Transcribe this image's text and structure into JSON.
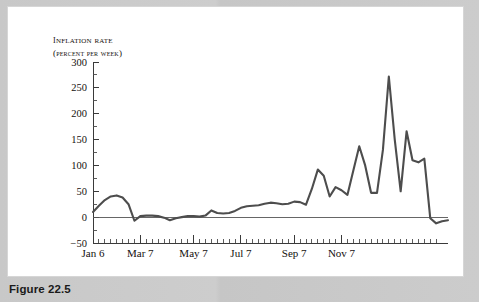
{
  "figure": {
    "caption": "Figure 22.5"
  },
  "chart_data": {
    "type": "line",
    "title": "",
    "ylabel_line1": "Inflation rate",
    "ylabel_line2": "(percent per week)",
    "xlabel": "",
    "ylim": [
      -50,
      300
    ],
    "grid": false,
    "legend": "none",
    "y_ticks": [
      300,
      250,
      200,
      150,
      100,
      50,
      0,
      -50
    ],
    "y_tick_labels": [
      "300",
      "250",
      "200",
      "150",
      "100",
      "50",
      "0",
      "−50"
    ],
    "y_minor_step": 25,
    "x_major_labels": [
      "Jan 6",
      "Mar 7",
      "May 7",
      "Jul 7",
      "Sep 7",
      "Nov 7"
    ],
    "x_major_indices": [
      0,
      8,
      17,
      25,
      34,
      42
    ],
    "x_minor_count": 52,
    "series": [
      {
        "name": "Inflation rate (percent per week)",
        "color": "#4d4d4d",
        "x": [
          0,
          1,
          2,
          3,
          4,
          5,
          6,
          7,
          8,
          9,
          10,
          11,
          12,
          13,
          14,
          15,
          16,
          17,
          18,
          19,
          20,
          21,
          22,
          23,
          24,
          25,
          26,
          27,
          28,
          29,
          30,
          31,
          32,
          33,
          34,
          35,
          36,
          37,
          38,
          39,
          40,
          41,
          42,
          43,
          44,
          45,
          46,
          47,
          48,
          49,
          50,
          51
        ],
        "values": [
          10,
          22,
          33,
          40,
          42,
          38,
          25,
          -7,
          2,
          3,
          3,
          2,
          -1,
          -6,
          -2,
          0,
          2,
          2,
          1,
          3,
          13,
          8,
          7,
          8,
          12,
          18,
          21,
          22,
          23,
          26,
          28,
          27,
          25,
          26,
          30,
          29,
          24,
          55,
          92,
          80,
          40,
          58,
          52,
          43,
          90,
          137,
          100,
          47,
          47,
          130,
          272,
          150
        ]
      }
    ],
    "series_tail": {
      "note": "continuation",
      "x": [
        52,
        53,
        54,
        55,
        56,
        57,
        58,
        59,
        60
      ],
      "values": [
        50,
        166,
        110,
        106,
        113,
        -2,
        -12,
        -8,
        -6
      ]
    }
  },
  "icons": {
    "chart": "line-chart-icon"
  }
}
